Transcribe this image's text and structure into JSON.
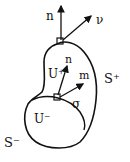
{
  "diagram": {
    "labels": {
      "n_outer": "n",
      "v_outer": "ν",
      "U_plus": "U⁺",
      "n_inner": "n",
      "m_inner": "m",
      "sigma": "σ",
      "S_plus": "S⁺",
      "U_minus": "U⁻",
      "S_minus": "S⁻"
    },
    "colors": {
      "stroke": "#111111",
      "background": "#ffffff"
    }
  }
}
